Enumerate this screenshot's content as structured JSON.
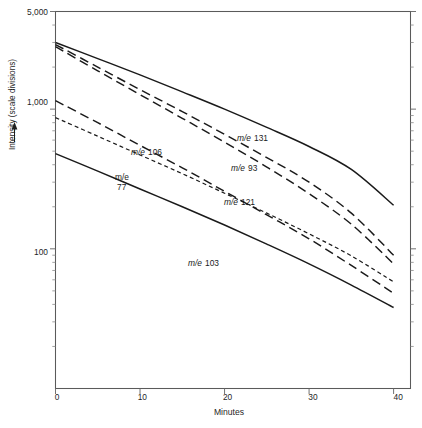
{
  "chart_data": {
    "type": "line",
    "title": "",
    "xlabel": "Minutes",
    "ylabel": "Intensity (scale divisions)",
    "ylabel_arrow": "↑",
    "xlim": [
      0,
      42
    ],
    "ylim": [
      10,
      5000
    ],
    "yscale": "log",
    "xscale": "linear",
    "grid": false,
    "legend": "inline-labels",
    "x_ticks": [
      {
        "value": 0,
        "label": "0"
      },
      {
        "value": 10,
        "label": "10"
      },
      {
        "value": 20,
        "label": "20"
      },
      {
        "value": 30,
        "label": "30"
      },
      {
        "value": 40,
        "label": "40"
      }
    ],
    "y_ticks": [
      {
        "value": 5000,
        "label": "5,000"
      },
      {
        "value": 1000,
        "label": "1,000"
      },
      {
        "value": 100,
        "label": "100"
      }
    ],
    "y_minor_ticks": [
      4000,
      3000,
      2000,
      900,
      800,
      700,
      600,
      500,
      400,
      300,
      200,
      90,
      80,
      70,
      60,
      50,
      40,
      30,
      20
    ],
    "x": [
      0,
      5,
      10,
      15,
      20,
      25,
      30,
      35,
      40
    ],
    "series": [
      {
        "name": "m/e 131",
        "label": "m/e 131",
        "label_prefix": "m/e",
        "label_value": "131",
        "linestyle": "solid",
        "color": "#1a1a1a",
        "values": [
          3000,
          2300,
          1760,
          1330,
          1000,
          740,
          540,
          370,
          205
        ]
      },
      {
        "name": "m/e 93",
        "label": "m/e 93",
        "label_prefix": "m/e",
        "label_value": "93",
        "linestyle": "long-dash",
        "color": "#1a1a1a",
        "values": [
          2900,
          2000,
          1380,
          960,
          660,
          450,
          300,
          180,
          90
        ]
      },
      {
        "name": "m/e 106",
        "label": "m/e 106",
        "label_prefix": "m/e",
        "label_value": "106",
        "linestyle": "long-dash",
        "color": "#1a1a1a",
        "values": [
          2800,
          1880,
          1270,
          860,
          580,
          385,
          248,
          150,
          78
        ]
      },
      {
        "name": "m/e 121",
        "label": "m/e 121",
        "label_prefix": "m/e",
        "label_value": "121",
        "linestyle": "long-dash",
        "color": "#1a1a1a",
        "values": [
          1150,
          800,
          550,
          380,
          258,
          175,
          118,
          76,
          48
        ]
      },
      {
        "name": "m/e 77",
        "label": "m/e 77",
        "label_prefix": "m/e",
        "label_value": "77",
        "linestyle": "short-dash",
        "color": "#1a1a1a",
        "values": [
          870,
          640,
          470,
          345,
          250,
          180,
          128,
          89,
          58
        ]
      },
      {
        "name": "m/e 103",
        "label": "m/e 103",
        "label_prefix": "m/e",
        "label_value": "103",
        "linestyle": "solid",
        "color": "#1a1a1a",
        "values": [
          480,
          360,
          268,
          200,
          148,
          108,
          78,
          55,
          38
        ]
      }
    ],
    "annotations": [
      {
        "text": "m/e 131",
        "x": 24.0,
        "y": 570
      },
      {
        "text": "m/e 93",
        "x": 23.3,
        "y": 290
      },
      {
        "text": "m/e 106",
        "x": 11.0,
        "y": 530
      },
      {
        "text": "m/e 121",
        "x": 20.3,
        "y": 182
      },
      {
        "text": "m/e 77",
        "x": 7.2,
        "y": 380
      },
      {
        "text": "m/e 103",
        "x": 14.6,
        "y": 95
      }
    ]
  },
  "axes": {
    "y_axis_label": "Intensity (scale divisions)",
    "x_axis_label": "Minutes",
    "y_top_label": "5,000",
    "y_mid_label": "1,000",
    "y_low_label": "100"
  },
  "series_labels": {
    "s131_prefix": "m/e",
    "s131_value": "131",
    "s93_prefix": "m/e",
    "s93_value": "93",
    "s106_prefix": "m/e",
    "s106_value": "106",
    "s121_prefix": "m/e",
    "s121_value": "121",
    "s77_prefix": "m/e",
    "s77_value": "77",
    "s103_prefix": "m/e",
    "s103_value": "103"
  },
  "xtick_labels": {
    "t0": "0",
    "t10": "10",
    "t20": "20",
    "t30": "30",
    "t40": "40"
  }
}
